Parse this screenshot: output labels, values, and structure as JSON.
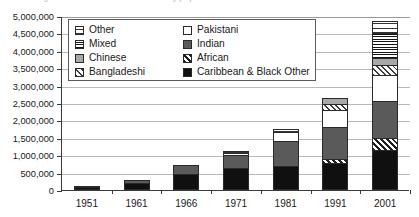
{
  "figure": {
    "caption": "Figure 2.1 Growth of ethnic minority populations"
  },
  "chart_data": {
    "type": "bar",
    "stacked": true,
    "title": "",
    "xlabel": "",
    "ylabel": "",
    "ylim": [
      0,
      5000000
    ],
    "ytick_step": 500000,
    "grid": true,
    "legend_position": "top-left-inside",
    "categories": [
      "1951",
      "1961",
      "1966",
      "1971",
      "1981",
      "1991",
      "2001"
    ],
    "ytick_labels": [
      "5,000,000",
      "4,500,000",
      "4,000,000",
      "3,500,000",
      "3,000,000",
      "2,500,000",
      "2,000,000",
      "1,500,000",
      "1,000,000",
      "500,000",
      "0"
    ],
    "series": [
      {
        "name": "Caribbean & Black Other",
        "fill": "f-caribbean",
        "values": [
          85000,
          210000,
          470000,
          620000,
          700000,
          770000,
          1150000
        ]
      },
      {
        "name": "African",
        "fill": "f-african",
        "values": [
          0,
          0,
          0,
          0,
          0,
          130000,
          350000
        ]
      },
      {
        "name": "Indian",
        "fill": "f-indian",
        "values": [
          25000,
          90000,
          240000,
          390000,
          700000,
          900000,
          1050000
        ]
      },
      {
        "name": "Pakistani",
        "fill": "f-pakistani",
        "values": [
          0,
          0,
          0,
          60000,
          270000,
          510000,
          750000
        ]
      },
      {
        "name": "Bangladeshi",
        "fill": "f-bangladeshi",
        "values": [
          0,
          0,
          0,
          0,
          0,
          160000,
          300000
        ]
      },
      {
        "name": "Chinese",
        "fill": "f-chinese",
        "values": [
          0,
          0,
          0,
          0,
          0,
          180000,
          200000
        ]
      },
      {
        "name": "Mixed",
        "fill": "f-mixed",
        "values": [
          0,
          0,
          0,
          0,
          0,
          0,
          700000
        ]
      },
      {
        "name": "Other",
        "fill": "f-other",
        "values": [
          0,
          0,
          0,
          40000,
          80000,
          0,
          350000
        ]
      }
    ],
    "totals": [
      110000,
      300000,
      710000,
      1110000,
      1750000,
      2650000,
      4850000
    ]
  },
  "legend": {
    "items": [
      {
        "label": "Other",
        "swatch": "f-other"
      },
      {
        "label": "Pakistani",
        "swatch": "f-pakistani"
      },
      {
        "label": "Mixed",
        "swatch": "f-mixed"
      },
      {
        "label": "Indian",
        "swatch": "f-indian"
      },
      {
        "label": "Chinese",
        "swatch": "f-chinese"
      },
      {
        "label": "African",
        "swatch": "f-african"
      },
      {
        "label": "Bangladeshi",
        "swatch": "f-bangladeshi"
      },
      {
        "label": "Caribbean & Black Other",
        "swatch": "f-caribbean"
      }
    ]
  }
}
